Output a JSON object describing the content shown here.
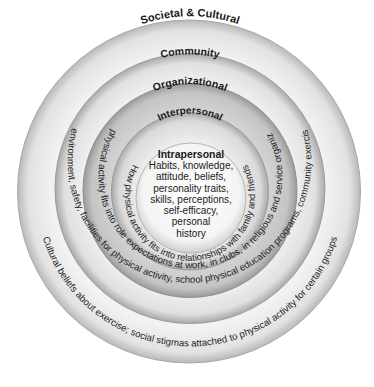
{
  "diagram": {
    "type": "social-ecological-model",
    "colors": {
      "background": "#ffffff",
      "societal_ring": "#e8e8e8",
      "community_ring": "#ececec",
      "organizational_ring": "#c8c8c8",
      "interpersonal_ring": "#dedede",
      "intrapersonal_core": "#f4f4f4",
      "text": "#1a1a1a"
    },
    "rings": [
      {
        "level": "Societal & Cultural",
        "description": "Cultural beliefs about exercise; social stigmas attached to physical activity for certain groups"
      },
      {
        "level": "Community",
        "description": "Physical environment, safety, facilities for physical activity, school physical education programs, community exercise classes"
      },
      {
        "level": "Organizational",
        "description": "How physical activity fits into role expectations at work, in clubs, in religious and service organizations"
      },
      {
        "level": "Interpersonal",
        "description": "How physical activity fits into relationships with family and friends"
      }
    ],
    "core": {
      "title": "Intrapersonal",
      "lines": [
        "Habits, knowledge,",
        "attitude, beliefs,",
        "personality traits,",
        "skills, perceptions,",
        "self-efficacy,",
        "personal",
        "history"
      ]
    }
  }
}
